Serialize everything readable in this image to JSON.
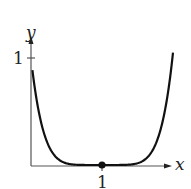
{
  "chart_data": {
    "type": "line",
    "title": "",
    "xlabel": "x",
    "ylabel": "y",
    "x_ticks": [
      "1"
    ],
    "y_ticks": [
      "1"
    ],
    "series": [
      {
        "name": "curve",
        "x": [
          0,
          0.25,
          0.5,
          0.75,
          1,
          1.25,
          1.5,
          1.75,
          2.0
        ],
        "y": [
          1.0,
          0.32,
          0.06,
          0.004,
          0,
          0.004,
          0.06,
          0.32,
          1.07
        ]
      }
    ],
    "points": [
      {
        "x": 1,
        "y": 0,
        "marker": "filled-circle"
      }
    ],
    "xlim": [
      0,
      2.1
    ],
    "ylim": [
      0,
      1.2
    ],
    "grid": false,
    "legend": "none"
  },
  "labels": {
    "x_axis": "x",
    "y_axis": "y",
    "x_tick": "1",
    "y_tick": "1"
  },
  "colors": {
    "line": "#111111",
    "axis": "#555555"
  }
}
